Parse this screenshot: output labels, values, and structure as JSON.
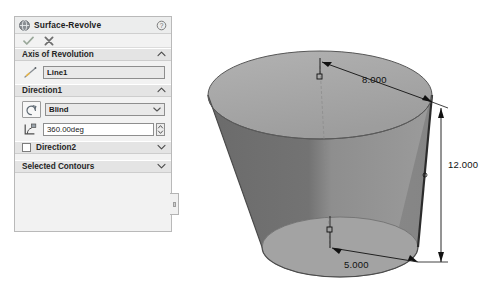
{
  "panel": {
    "title": "Surface-Revolve",
    "title_icon": "surface-revolve-icon",
    "help_icon": "help-icon",
    "ok_label": "OK",
    "cancel_label": "Cancel",
    "sections": {
      "axis": {
        "label": "Axis of Revolution",
        "chevron": "chevron-up",
        "axis_icon": "axis-line-icon",
        "selection_value": "Line1"
      },
      "direction1": {
        "label": "Direction1",
        "chevron": "chevron-up",
        "type_icon": "revolve-direction-icon",
        "type_value": "Blind",
        "type_chevron": "chevron-down",
        "angle_icon": "revolve-angle-icon",
        "angle_value": "360.00deg",
        "spinner": "spinner-up-down"
      },
      "direction2": {
        "label": "Direction2",
        "checkbox_checked": false,
        "chevron": "chevron-down"
      },
      "selected_contours": {
        "label": "Selected Contours",
        "chevron": "chevron-down"
      }
    },
    "tab_handle": "panel-resize-handle"
  },
  "viewport": {
    "model_name": "revolved-surface-frustum",
    "dimensions": [
      {
        "id": "top-radius",
        "value": "8.000"
      },
      {
        "id": "height",
        "value": "12.000"
      },
      {
        "id": "bottom-radius",
        "value": "5.000"
      }
    ],
    "origin_markers": [
      {
        "id": "top-origin-point"
      },
      {
        "id": "bottom-origin-point"
      }
    ],
    "colors": {
      "face_outer": "#8d8d8d",
      "face_top": "#a8a8a8",
      "face_inner_dark": "#6f6f6f",
      "face_inner_light": "#9a9a9a",
      "bottom_ellipse": "#a2a2a2",
      "edge": "#3a3a3a",
      "dimension": "#111111",
      "background": "#ffffff"
    }
  }
}
